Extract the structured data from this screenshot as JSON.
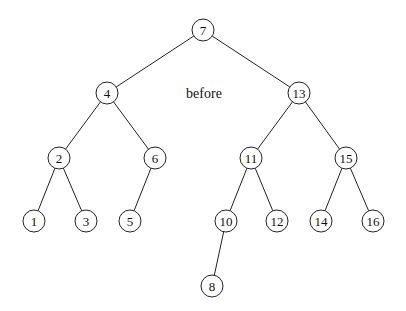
{
  "diagram": {
    "type": "binary-search-tree",
    "caption": "before",
    "caption_pos": [
      204,
      93
    ],
    "node_radius": 11,
    "nodes": [
      {
        "id": "7",
        "label": "7",
        "x": 203,
        "y": 30
      },
      {
        "id": "4",
        "label": "4",
        "x": 107,
        "y": 93
      },
      {
        "id": "13",
        "label": "13",
        "x": 299,
        "y": 93
      },
      {
        "id": "2",
        "label": "2",
        "x": 59,
        "y": 158
      },
      {
        "id": "6",
        "label": "6",
        "x": 155,
        "y": 158
      },
      {
        "id": "11",
        "label": "11",
        "x": 251,
        "y": 158
      },
      {
        "id": "15",
        "label": "15",
        "x": 346,
        "y": 158
      },
      {
        "id": "1",
        "label": "1",
        "x": 34,
        "y": 221
      },
      {
        "id": "3",
        "label": "3",
        "x": 86,
        "y": 221
      },
      {
        "id": "5",
        "label": "5",
        "x": 130,
        "y": 221
      },
      {
        "id": "10",
        "label": "10",
        "x": 226,
        "y": 221
      },
      {
        "id": "12",
        "label": "12",
        "x": 277,
        "y": 221
      },
      {
        "id": "14",
        "label": "14",
        "x": 321,
        "y": 221
      },
      {
        "id": "16",
        "label": "16",
        "x": 373,
        "y": 221
      },
      {
        "id": "8",
        "label": "8",
        "x": 212,
        "y": 286
      }
    ],
    "edges": [
      [
        "7",
        "4"
      ],
      [
        "7",
        "13"
      ],
      [
        "4",
        "2"
      ],
      [
        "4",
        "6"
      ],
      [
        "13",
        "11"
      ],
      [
        "13",
        "15"
      ],
      [
        "2",
        "1"
      ],
      [
        "2",
        "3"
      ],
      [
        "6",
        "5"
      ],
      [
        "11",
        "10"
      ],
      [
        "11",
        "12"
      ],
      [
        "15",
        "14"
      ],
      [
        "15",
        "16"
      ],
      [
        "10",
        "8"
      ]
    ]
  }
}
